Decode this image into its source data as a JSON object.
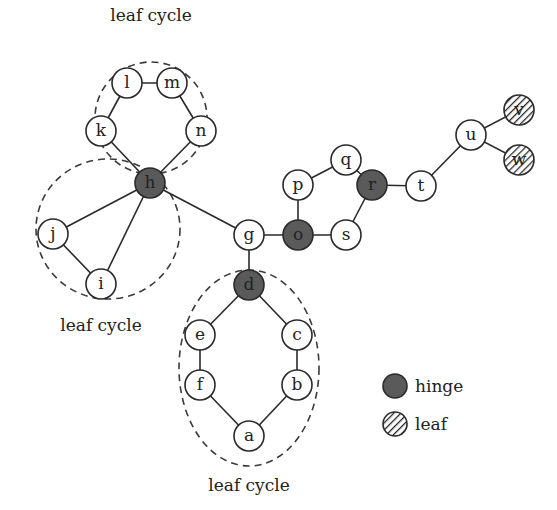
{
  "diagram": {
    "captions": [
      {
        "text": "leaf cycle",
        "x": 151,
        "y": 21
      },
      {
        "text": "leaf cycle",
        "x": 101,
        "y": 331
      },
      {
        "text": "leaf cycle",
        "x": 249,
        "y": 491
      }
    ],
    "cycles": [
      {
        "cx": 151,
        "cy": 118,
        "rx": 56,
        "ry": 56
      },
      {
        "cx": 108,
        "cy": 229,
        "rx": 72,
        "ry": 70
      },
      {
        "cx": 249,
        "cy": 368,
        "rx": 70,
        "ry": 98
      }
    ],
    "nodes": [
      {
        "id": "a",
        "x": 249,
        "y": 436,
        "type": "normal"
      },
      {
        "id": "b",
        "x": 297,
        "y": 385,
        "type": "normal"
      },
      {
        "id": "c",
        "x": 297,
        "y": 335,
        "type": "normal"
      },
      {
        "id": "d",
        "x": 249,
        "y": 285,
        "type": "hinge"
      },
      {
        "id": "e",
        "x": 200,
        "y": 335,
        "type": "normal"
      },
      {
        "id": "f",
        "x": 200,
        "y": 385,
        "type": "normal"
      },
      {
        "id": "g",
        "x": 249,
        "y": 235,
        "type": "normal"
      },
      {
        "id": "h",
        "x": 150,
        "y": 183,
        "type": "hinge"
      },
      {
        "id": "i",
        "x": 101,
        "y": 284,
        "type": "normal"
      },
      {
        "id": "j",
        "x": 53,
        "y": 234,
        "type": "normal"
      },
      {
        "id": "k",
        "x": 101,
        "y": 131,
        "type": "normal"
      },
      {
        "id": "l",
        "x": 127,
        "y": 83,
        "type": "normal"
      },
      {
        "id": "m",
        "x": 172,
        "y": 83,
        "type": "normal"
      },
      {
        "id": "n",
        "x": 201,
        "y": 131,
        "type": "normal"
      },
      {
        "id": "o",
        "x": 298,
        "y": 235,
        "type": "hinge"
      },
      {
        "id": "p",
        "x": 298,
        "y": 185,
        "type": "normal"
      },
      {
        "id": "q",
        "x": 346,
        "y": 160,
        "type": "normal"
      },
      {
        "id": "r",
        "x": 372,
        "y": 185,
        "type": "hinge"
      },
      {
        "id": "s",
        "x": 346,
        "y": 235,
        "type": "normal"
      },
      {
        "id": "t",
        "x": 421,
        "y": 186,
        "type": "normal"
      },
      {
        "id": "u",
        "x": 471,
        "y": 135,
        "type": "normal"
      },
      {
        "id": "v",
        "x": 519,
        "y": 110,
        "type": "leaf"
      },
      {
        "id": "w",
        "x": 519,
        "y": 160,
        "type": "leaf"
      }
    ],
    "edges": [
      [
        "a",
        "b"
      ],
      [
        "b",
        "c"
      ],
      [
        "c",
        "d"
      ],
      [
        "d",
        "e"
      ],
      [
        "e",
        "f"
      ],
      [
        "f",
        "a"
      ],
      [
        "d",
        "g"
      ],
      [
        "g",
        "h"
      ],
      [
        "g",
        "o"
      ],
      [
        "h",
        "i"
      ],
      [
        "h",
        "j"
      ],
      [
        "i",
        "j"
      ],
      [
        "h",
        "k"
      ],
      [
        "k",
        "l"
      ],
      [
        "l",
        "m"
      ],
      [
        "m",
        "n"
      ],
      [
        "n",
        "h"
      ],
      [
        "o",
        "p"
      ],
      [
        "p",
        "q"
      ],
      [
        "q",
        "r"
      ],
      [
        "r",
        "s"
      ],
      [
        "s",
        "o"
      ],
      [
        "r",
        "t"
      ],
      [
        "t",
        "u"
      ],
      [
        "u",
        "v"
      ],
      [
        "u",
        "w"
      ]
    ],
    "legend": [
      {
        "label": "hinge",
        "type": "hinge",
        "x": 395,
        "y": 386
      },
      {
        "label": "leaf",
        "type": "leaf",
        "x": 395,
        "y": 424
      }
    ],
    "colors": {
      "hinge_fill": "#5a5a5a",
      "normal_fill": "#ffffff",
      "stroke": "#2a2a2a"
    }
  }
}
